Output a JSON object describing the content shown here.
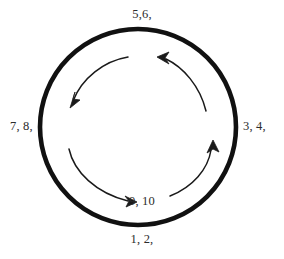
{
  "diagram": {
    "type": "cycle-diagram",
    "background_color": "#ffffff",
    "stroke_color": "#111111",
    "text_color": "#2b2b2b",
    "outer_circle": {
      "center_x": 138,
      "center_y": 127,
      "radius": 98,
      "stroke_width": 4.5
    },
    "labels": {
      "top": "5,6,",
      "right": "3, 4,",
      "left": "7, 8,",
      "bottom": "1, 2,",
      "inner_bottom": "9, 10"
    },
    "arrows": [
      {
        "name": "arrow-top-left",
        "direction": "counter-clockwise",
        "head_x": 70,
        "head_y": 108,
        "head_angle_deg": 246
      },
      {
        "name": "arrow-bottom-right",
        "direction": "counter-clockwise",
        "head_x": 136,
        "head_y": 202,
        "head_angle_deg": 8
      },
      {
        "name": "arrow-right-up",
        "direction": "counter-clockwise",
        "head_x": 213,
        "head_y": 141,
        "head_angle_deg": 288
      },
      {
        "name": "arrow-top-right",
        "direction": "counter-clockwise",
        "head_x": 158,
        "head_y": 58,
        "head_angle_deg": 196
      }
    ]
  }
}
